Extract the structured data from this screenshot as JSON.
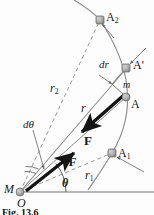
{
  "figure": {
    "caption": "Fig. 13.6",
    "colors": {
      "curve": "#8d8d8d",
      "dashed": "#9a9a9a",
      "radius_line": "#8a8a8a",
      "force_arrow": "#141414",
      "node_fill": "#a8a8a8",
      "node_stroke": "#6f6f6f",
      "axis": "#6f6f6f",
      "text": "#1a1a1a",
      "background": "#fdfdfd"
    },
    "points": [
      {
        "name": "M",
        "label": "M",
        "x": 20,
        "y": 192,
        "label_x": 4,
        "label_y": 185,
        "italic": true,
        "node": true
      },
      {
        "name": "O",
        "label": "O",
        "x": 20,
        "y": 192,
        "label_x": 17,
        "label_y": 198,
        "italic": true,
        "node": false
      },
      {
        "name": "A",
        "label": "A",
        "x": 126,
        "y": 97,
        "label_x": 131,
        "label_y": 99,
        "italic": false,
        "node": true
      },
      {
        "name": "Aprime",
        "label": "A'",
        "x": 126,
        "y": 68,
        "label_x": 133,
        "label_y": 61,
        "italic": false,
        "node": true
      },
      {
        "name": "A1",
        "label": "A",
        "sub": "1",
        "x": 112,
        "y": 153,
        "label_x": 119,
        "label_y": 148,
        "italic": false,
        "node": true
      },
      {
        "name": "A2",
        "label": "A",
        "sub": "2",
        "x": 100,
        "y": 20,
        "label_x": 107,
        "label_y": 13,
        "italic": false,
        "node": true
      }
    ],
    "labels": [
      {
        "name": "label-r2",
        "text": "r",
        "sub": "2",
        "x": 52,
        "y": 85,
        "style": "italic",
        "size": 12
      },
      {
        "name": "label-r",
        "text": "r",
        "sub": "",
        "x": 82,
        "y": 105,
        "style": "italic",
        "size": 12
      },
      {
        "name": "label-r1",
        "text": "r",
        "sub": "1",
        "x": 86,
        "y": 172,
        "style": "italic",
        "size": 12
      },
      {
        "name": "label-dtheta",
        "text": "dθ",
        "sub": "",
        "x": 24,
        "y": 122,
        "style": "italic",
        "size": 11
      },
      {
        "name": "label-dr",
        "text": "dr",
        "sub": "",
        "x": 100,
        "y": 62,
        "style": "italic",
        "size": 11
      },
      {
        "name": "label-theta",
        "text": "θ",
        "sub": "",
        "x": 62,
        "y": 180,
        "style": "italic-bold",
        "size": 12
      },
      {
        "name": "label-mass-m",
        "text": "m",
        "sub": "",
        "x": 124,
        "y": 83,
        "style": "italic",
        "size": 10
      },
      {
        "name": "label-force-F",
        "text": "F",
        "sub": "",
        "x": 85,
        "y": 137,
        "style": "bold",
        "size": 13
      },
      {
        "name": "label-force-minusF",
        "text": "–F",
        "sub": "",
        "x": 63,
        "y": 158,
        "style": "bold",
        "size": 13
      }
    ],
    "geometry": {
      "origin": {
        "x": 20,
        "y": 192
      },
      "axis_line": {
        "x1": 20,
        "y1": 192,
        "x2": 154,
        "y2": 192
      },
      "trajectory": "M 74,0 C 84,6 94,13 100,20 C 112,38 122,58 126,80 C 130,104 126,130 112,153 C 104,167 96,178 88,190",
      "radius_r": {
        "x1": 20,
        "y1": 192,
        "x2": 124,
        "y2": 72
      },
      "radius_rA": {
        "x1": 20,
        "y1": 192,
        "x2": 126,
        "y2": 97
      },
      "radius_r1": {
        "x1": 20,
        "y1": 192,
        "x2": 112,
        "y2": 153
      },
      "radius_r2": {
        "x1": 20,
        "y1": 192,
        "x2": 100,
        "y2": 20
      },
      "force_arrow": {
        "x1": 124,
        "y1": 96,
        "x2": 80,
        "y2": 134
      },
      "minus_force_arrow": {
        "x1": 30,
        "y1": 188,
        "x2": 76,
        "y2": 152
      },
      "dr_segment": {
        "x1": 112,
        "y1": 84,
        "x2": 126,
        "y2": 68
      },
      "theta_arc_radius": 46,
      "dtheta_arc_radius": 26
    },
    "leaders": [
      {
        "name": "leader-dr",
        "x1": 99,
        "y1": 75,
        "x2": 113,
        "y2": 84
      },
      {
        "name": "leader-aprime",
        "x1": 144,
        "y1": 50,
        "x2": 129,
        "y2": 65
      },
      {
        "name": "leader-a2",
        "x1": 113,
        "y1": 37,
        "x2": 101,
        "y2": 24
      },
      {
        "name": "leader-dtheta",
        "x1": 33,
        "y1": 129,
        "x2": 44,
        "y2": 170
      },
      {
        "name": "leader-a1",
        "x1": 142,
        "y1": 171,
        "x2": 116,
        "y2": 156
      }
    ]
  }
}
